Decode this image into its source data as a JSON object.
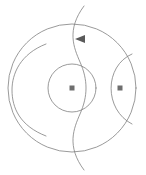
{
  "figure": {
    "background_color": "#ffffff",
    "stroke_color": "#808080",
    "marker_color": "#6e6e6e",
    "arrow_color": "#5a5a5a",
    "canvas": {
      "width": 146,
      "height": 175
    }
  },
  "chart_data": {
    "type": "diagram",
    "title": "",
    "xlabel": "",
    "ylabel": "",
    "grid": false,
    "legend": null,
    "elements": [
      {
        "name": "outer-circle",
        "kind": "circle",
        "cx": 72,
        "cy": 88,
        "r": 64,
        "stroke": "#808080"
      },
      {
        "name": "inner-circle",
        "kind": "circle",
        "cx": 72,
        "cy": 88,
        "r": 24,
        "stroke": "#808080"
      },
      {
        "name": "s-curve",
        "kind": "path",
        "d": "M 84 6 C 66 30 74 48 80 62 C 88 80 88 96 80 114 C 74 128 66 146 84 170",
        "stroke": "#808080"
      },
      {
        "name": "left-arc",
        "kind": "path",
        "d": "M 46 44 C 20 54 12 74 12 90 C 12 108 20 126 46 136",
        "stroke": "#808080"
      },
      {
        "name": "right-lens-arc",
        "kind": "path",
        "d": "M 132 54 C 104 66 104 110 132 124",
        "stroke": "#808080"
      }
    ],
    "markers": [
      {
        "name": "center-point",
        "kind": "square",
        "x": 72,
        "y": 88,
        "size": 5
      },
      {
        "name": "focus-point-right",
        "kind": "square",
        "x": 120,
        "y": 88,
        "size": 5
      }
    ],
    "arrows": [
      {
        "name": "direction-arrow",
        "kind": "triangle",
        "x": 80,
        "y": 39,
        "size": 5,
        "direction": "left"
      }
    ]
  }
}
